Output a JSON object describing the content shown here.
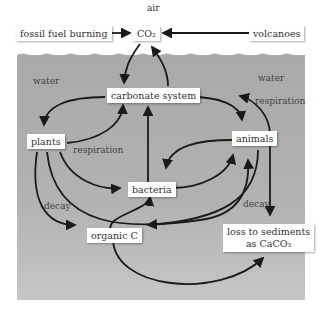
{
  "regions": {
    "air": "air",
    "water_left": "water",
    "water_right": "water"
  },
  "nodes": {
    "fossil": "fossil fuel burning",
    "co2": "CO₂",
    "volcanoes": "volcanoes",
    "carbonate": "carbonate system",
    "plants": "plants",
    "animals": "animals",
    "bacteria": "bacteria",
    "organic": "organic C",
    "loss1": "loss to sediments",
    "loss2": "as CaCO₃"
  },
  "edge_labels": {
    "resp_plants": "respiration",
    "resp_animals": "respiration",
    "decay_left": "decay",
    "decay_right": "decay"
  },
  "colors": {
    "water": "#adadad",
    "arrow": "#1a1a1a",
    "box": "#ffffff"
  }
}
